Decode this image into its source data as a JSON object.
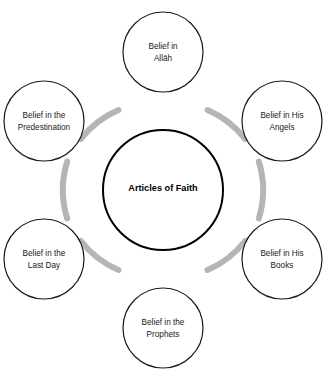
{
  "diagram": {
    "title": "Articles of Faith",
    "type": "cycle-hub-and-spoke",
    "center": {
      "label": "Articles of Faith",
      "lines": [
        "Articles of Faith"
      ],
      "shape": "circle",
      "fill": "#ffffff",
      "stroke": "#000000"
    },
    "connector": {
      "color": "#b5b5b5",
      "style": "thick-arc"
    },
    "node_style": {
      "fill": "#ffffff",
      "stroke": "#1a1a1a"
    },
    "nodes": [
      {
        "id": "belief-in-allah",
        "label": "Belief in Allāh",
        "lines": [
          "Belief in",
          "Allāh"
        ],
        "position": "top"
      },
      {
        "id": "belief-in-his-angels",
        "label": "Belief in His Angels",
        "lines": [
          "Belief in His",
          "Angels"
        ],
        "position": "top-right"
      },
      {
        "id": "belief-in-his-books",
        "label": "Belief in His Books",
        "lines": [
          "Belief in His",
          "Books"
        ],
        "position": "bottom-right"
      },
      {
        "id": "belief-in-the-prophets",
        "label": "Belief in the Prophets",
        "lines": [
          "Belief in the",
          "Prophets"
        ],
        "position": "bottom"
      },
      {
        "id": "belief-in-the-last-day",
        "label": "Belief in the Last Day",
        "lines": [
          "Belief in the",
          "Last Day"
        ],
        "position": "bottom-left"
      },
      {
        "id": "belief-in-the-predestination",
        "label": "Belief in the Predestination",
        "lines": [
          "Belief in the",
          "Predestination"
        ],
        "position": "top-left"
      }
    ]
  }
}
